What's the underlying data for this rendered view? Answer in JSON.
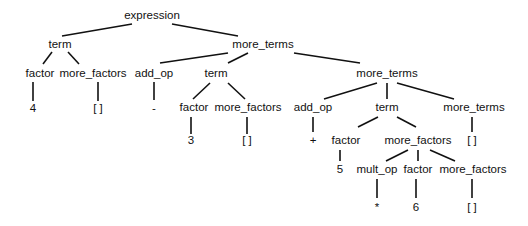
{
  "diagram": {
    "type": "parse-tree",
    "root": "expression",
    "nodes": [
      {
        "id": "n0",
        "label": "expression",
        "x": 152,
        "y": 16
      },
      {
        "id": "n1",
        "label": "term",
        "x": 60,
        "y": 45
      },
      {
        "id": "n2",
        "label": "more_terms",
        "x": 263,
        "y": 45
      },
      {
        "id": "n3",
        "label": "factor",
        "x": 40,
        "y": 74
      },
      {
        "id": "n4",
        "label": "more_factors",
        "x": 93,
        "y": 74
      },
      {
        "id": "n5",
        "label": "4",
        "x": 33,
        "y": 109
      },
      {
        "id": "n6",
        "label": "[ ]",
        "x": 98,
        "y": 109
      },
      {
        "id": "n7",
        "label": "add_op",
        "x": 154,
        "y": 74
      },
      {
        "id": "n8",
        "label": "-",
        "x": 154,
        "y": 109
      },
      {
        "id": "n9",
        "label": "term",
        "x": 216,
        "y": 74
      },
      {
        "id": "n10",
        "label": "more_terms",
        "x": 387,
        "y": 74
      },
      {
        "id": "n11",
        "label": "factor",
        "x": 194,
        "y": 108
      },
      {
        "id": "n12",
        "label": "more_factors",
        "x": 248,
        "y": 108
      },
      {
        "id": "n13",
        "label": "3",
        "x": 191,
        "y": 141
      },
      {
        "id": "n14",
        "label": "[ ]",
        "x": 247,
        "y": 141
      },
      {
        "id": "n15",
        "label": "add_op",
        "x": 313,
        "y": 108
      },
      {
        "id": "n16",
        "label": "+",
        "x": 313,
        "y": 141
      },
      {
        "id": "n17",
        "label": "term",
        "x": 387,
        "y": 108
      },
      {
        "id": "n18",
        "label": "more_terms",
        "x": 474,
        "y": 108
      },
      {
        "id": "n19",
        "label": "factor",
        "x": 346,
        "y": 141
      },
      {
        "id": "n20",
        "label": "more_factors",
        "x": 418,
        "y": 141
      },
      {
        "id": "n21",
        "label": "[ ]",
        "x": 472,
        "y": 141
      },
      {
        "id": "n22",
        "label": "5",
        "x": 340,
        "y": 170
      },
      {
        "id": "n23",
        "label": "mult_op",
        "x": 377,
        "y": 170
      },
      {
        "id": "n24",
        "label": "factor",
        "x": 418,
        "y": 170
      },
      {
        "id": "n25",
        "label": "more_factors",
        "x": 473,
        "y": 170
      },
      {
        "id": "n26",
        "label": "*",
        "x": 377,
        "y": 208
      },
      {
        "id": "n27",
        "label": "6",
        "x": 416,
        "y": 208
      },
      {
        "id": "n28",
        "label": "[ ]",
        "x": 472,
        "y": 208
      }
    ],
    "edges": [
      {
        "x1": 132,
        "y1": 24,
        "x2": 62,
        "y2": 36
      },
      {
        "x1": 172,
        "y1": 24,
        "x2": 238,
        "y2": 36
      },
      {
        "x1": 52,
        "y1": 52,
        "x2": 43,
        "y2": 64
      },
      {
        "x1": 68,
        "y1": 52,
        "x2": 79,
        "y2": 64
      },
      {
        "x1": 33,
        "y1": 82,
        "x2": 33,
        "y2": 101
      },
      {
        "x1": 98,
        "y1": 82,
        "x2": 98,
        "y2": 101
      },
      {
        "x1": 154,
        "y1": 82,
        "x2": 154,
        "y2": 100
      },
      {
        "x1": 228,
        "y1": 53,
        "x2": 160,
        "y2": 63
      },
      {
        "x1": 248,
        "y1": 53,
        "x2": 228,
        "y2": 63
      },
      {
        "x1": 294,
        "y1": 53,
        "x2": 360,
        "y2": 63
      },
      {
        "x1": 210,
        "y1": 83,
        "x2": 193,
        "y2": 99
      },
      {
        "x1": 228,
        "y1": 83,
        "x2": 245,
        "y2": 99
      },
      {
        "x1": 191,
        "y1": 117,
        "x2": 191,
        "y2": 134
      },
      {
        "x1": 247,
        "y1": 117,
        "x2": 247,
        "y2": 134
      },
      {
        "x1": 377,
        "y1": 83,
        "x2": 324,
        "y2": 99
      },
      {
        "x1": 387,
        "y1": 83,
        "x2": 387,
        "y2": 99
      },
      {
        "x1": 397,
        "y1": 83,
        "x2": 454,
        "y2": 99
      },
      {
        "x1": 313,
        "y1": 117,
        "x2": 313,
        "y2": 132
      },
      {
        "x1": 378,
        "y1": 117,
        "x2": 358,
        "y2": 127
      },
      {
        "x1": 397,
        "y1": 117,
        "x2": 416,
        "y2": 127
      },
      {
        "x1": 472,
        "y1": 117,
        "x2": 472,
        "y2": 132
      },
      {
        "x1": 340,
        "y1": 150,
        "x2": 340,
        "y2": 161
      },
      {
        "x1": 408,
        "y1": 150,
        "x2": 386,
        "y2": 161
      },
      {
        "x1": 418,
        "y1": 150,
        "x2": 418,
        "y2": 161
      },
      {
        "x1": 430,
        "y1": 150,
        "x2": 455,
        "y2": 161
      },
      {
        "x1": 377,
        "y1": 179,
        "x2": 377,
        "y2": 198
      },
      {
        "x1": 416,
        "y1": 179,
        "x2": 416,
        "y2": 198
      },
      {
        "x1": 472,
        "y1": 179,
        "x2": 472,
        "y2": 198
      }
    ],
    "colors": {
      "line": "#111111",
      "text": "#111111",
      "background": "#ffffff"
    }
  }
}
